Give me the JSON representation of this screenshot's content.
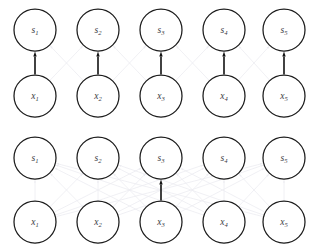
{
  "figure": {
    "background_color": "#ffffff",
    "node_stroke_color": "#1b1b1b",
    "node_fill_color": "#ffffff",
    "label_color": "#3a3a44",
    "active_edge_color": "#121212",
    "faint_edge_color": "#ececf1"
  },
  "layout": {
    "columns": 5,
    "column_x": [
      35,
      98,
      161,
      224,
      284
    ],
    "node_radius": 21,
    "panels": [
      {
        "name": "top-panel",
        "s_row_y": 30,
        "x_row_y": 96,
        "offset_y": 0
      },
      {
        "name": "bottom-panel",
        "s_row_y": 30,
        "x_row_y": 94,
        "offset_y": 128
      }
    ]
  },
  "panels": [
    {
      "id": "top-panel",
      "name": "top-panel",
      "s_nodes": [
        {
          "id": "s1",
          "base": "s",
          "sub": "1"
        },
        {
          "id": "s2",
          "base": "s",
          "sub": "2"
        },
        {
          "id": "s3",
          "base": "s",
          "sub": "3"
        },
        {
          "id": "s4",
          "base": "s",
          "sub": "4"
        },
        {
          "id": "s5",
          "base": "s",
          "sub": "5"
        }
      ],
      "x_nodes": [
        {
          "id": "x1",
          "base": "x",
          "sub": "1"
        },
        {
          "id": "x2",
          "base": "x",
          "sub": "2"
        },
        {
          "id": "x3",
          "base": "x",
          "sub": "3"
        },
        {
          "id": "x4",
          "base": "x",
          "sub": "4"
        },
        {
          "id": "x5",
          "base": "x",
          "sub": "5"
        }
      ],
      "active_edges": [
        {
          "from": "x1",
          "to": "s1",
          "column": 0
        },
        {
          "from": "x2",
          "to": "s2",
          "column": 1
        },
        {
          "from": "x3",
          "to": "s3",
          "column": 2
        },
        {
          "from": "x4",
          "to": "s4",
          "column": 3
        },
        {
          "from": "x5",
          "to": "s5",
          "column": 4
        }
      ],
      "faint_edges": [
        {
          "from": "x1",
          "to": "s2"
        },
        {
          "from": "x2",
          "to": "s1"
        },
        {
          "from": "x2",
          "to": "s3"
        },
        {
          "from": "x3",
          "to": "s2"
        },
        {
          "from": "x3",
          "to": "s4"
        },
        {
          "from": "x4",
          "to": "s3"
        },
        {
          "from": "x4",
          "to": "s5"
        },
        {
          "from": "x5",
          "to": "s4"
        }
      ]
    },
    {
      "id": "bottom-panel",
      "name": "bottom-panel",
      "s_nodes": [
        {
          "id": "s1",
          "base": "s",
          "sub": "1"
        },
        {
          "id": "s2",
          "base": "s",
          "sub": "2"
        },
        {
          "id": "s3",
          "base": "s",
          "sub": "3"
        },
        {
          "id": "s4",
          "base": "s",
          "sub": "4"
        },
        {
          "id": "s5",
          "base": "s",
          "sub": "5"
        }
      ],
      "x_nodes": [
        {
          "id": "x1",
          "base": "x",
          "sub": "1"
        },
        {
          "id": "x2",
          "base": "x",
          "sub": "2"
        },
        {
          "id": "x3",
          "base": "x",
          "sub": "3"
        },
        {
          "id": "x4",
          "base": "x",
          "sub": "4"
        },
        {
          "id": "x5",
          "base": "x",
          "sub": "5"
        }
      ],
      "active_edges": [
        {
          "from": "x3",
          "to": "s3",
          "column": 2
        }
      ],
      "faint_edges": [
        {
          "from": "x1",
          "to": "s1"
        },
        {
          "from": "x2",
          "to": "s2"
        },
        {
          "from": "x4",
          "to": "s4"
        },
        {
          "from": "x5",
          "to": "s5"
        },
        {
          "from": "x1",
          "to": "s2"
        },
        {
          "from": "x2",
          "to": "s1"
        },
        {
          "from": "x2",
          "to": "s3"
        },
        {
          "from": "x3",
          "to": "s2"
        },
        {
          "from": "x3",
          "to": "s4"
        },
        {
          "from": "x4",
          "to": "s3"
        },
        {
          "from": "x4",
          "to": "s5"
        },
        {
          "from": "x5",
          "to": "s4"
        },
        {
          "from": "x1",
          "to": "s3"
        },
        {
          "from": "x3",
          "to": "s1"
        },
        {
          "from": "x2",
          "to": "s4"
        },
        {
          "from": "x4",
          "to": "s2"
        },
        {
          "from": "x3",
          "to": "s5"
        },
        {
          "from": "x5",
          "to": "s3"
        },
        {
          "from": "x1",
          "to": "s4"
        },
        {
          "from": "x4",
          "to": "s1"
        },
        {
          "from": "x2",
          "to": "s5"
        },
        {
          "from": "x5",
          "to": "s2"
        },
        {
          "from": "x1",
          "to": "s5"
        },
        {
          "from": "x5",
          "to": "s1"
        }
      ]
    }
  ]
}
